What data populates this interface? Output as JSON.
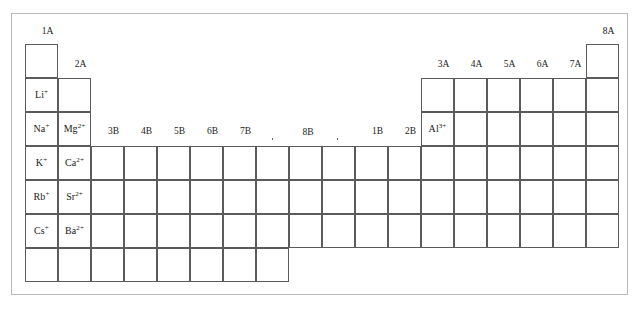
{
  "figure": {
    "frame": {
      "x": 11,
      "y": 13,
      "width": 617,
      "height": 282
    }
  },
  "grid": {
    "cell_width": 33,
    "cell_height": 34,
    "origin_x": 25,
    "origin_y": 44,
    "columns": 18,
    "rows": 7
  },
  "group_headers": [
    {
      "label": "1A",
      "column": 1,
      "x": 31,
      "y": 27
    },
    {
      "label": "2A",
      "column": 2,
      "x": 64,
      "y": 60
    },
    {
      "label": "3B",
      "column": 3,
      "x": 97,
      "y": 127
    },
    {
      "label": "4B",
      "column": 4,
      "x": 130,
      "y": 127
    },
    {
      "label": "5B",
      "column": 5,
      "x": 163,
      "y": 127
    },
    {
      "label": "6B",
      "column": 6,
      "x": 196,
      "y": 127
    },
    {
      "label": "7B",
      "column": 7,
      "x": 229,
      "y": 127
    },
    {
      "label": "1B",
      "column": 11,
      "x": 361,
      "y": 127
    },
    {
      "label": "2B",
      "column": 12,
      "x": 394,
      "y": 127
    },
    {
      "label": "3A",
      "column": 13,
      "x": 427,
      "y": 60
    },
    {
      "label": "4A",
      "column": 14,
      "x": 460,
      "y": 60
    },
    {
      "label": "5A",
      "column": 15,
      "x": 493,
      "y": 60
    },
    {
      "label": "6A",
      "column": 16,
      "x": 526,
      "y": 60
    },
    {
      "label": "7A",
      "column": 17,
      "x": 559,
      "y": 60
    },
    {
      "label": "8A",
      "column": 18,
      "x": 592,
      "y": 27
    }
  ],
  "bracket_8b": {
    "label": "8B",
    "start_column": 8,
    "end_column": 10,
    "x": 272,
    "y": 134,
    "width": 66
  },
  "ions": [
    {
      "symbol": "Li",
      "charge": "+",
      "column": 1,
      "row": 2
    },
    {
      "symbol": "Na",
      "charge": "+",
      "column": 1,
      "row": 3
    },
    {
      "symbol": "K",
      "charge": "+",
      "column": 1,
      "row": 4
    },
    {
      "symbol": "Rb",
      "charge": "+",
      "column": 1,
      "row": 5
    },
    {
      "symbol": "Cs",
      "charge": "+",
      "column": 1,
      "row": 6
    },
    {
      "symbol": "Mg",
      "charge": "2+",
      "column": 2,
      "row": 3
    },
    {
      "symbol": "Ca",
      "charge": "2+",
      "column": 2,
      "row": 4
    },
    {
      "symbol": "Sr",
      "charge": "2+",
      "column": 2,
      "row": 5
    },
    {
      "symbol": "Ba",
      "charge": "2+",
      "column": 2,
      "row": 6
    },
    {
      "symbol": "Al",
      "charge": "3+",
      "column": 13,
      "row": 3
    }
  ],
  "column_extents": [
    {
      "column": 1,
      "first_row": 1,
      "last_row": 7
    },
    {
      "column": 2,
      "first_row": 2,
      "last_row": 7
    },
    {
      "column": 3,
      "first_row": 4,
      "last_row": 7
    },
    {
      "column": 4,
      "first_row": 4,
      "last_row": 7
    },
    {
      "column": 5,
      "first_row": 4,
      "last_row": 7
    },
    {
      "column": 6,
      "first_row": 4,
      "last_row": 7
    },
    {
      "column": 7,
      "first_row": 4,
      "last_row": 7
    },
    {
      "column": 8,
      "first_row": 4,
      "last_row": 7
    },
    {
      "column": 9,
      "first_row": 4,
      "last_row": 6
    },
    {
      "column": 10,
      "first_row": 4,
      "last_row": 6
    },
    {
      "column": 11,
      "first_row": 4,
      "last_row": 6
    },
    {
      "column": 12,
      "first_row": 4,
      "last_row": 6
    },
    {
      "column": 13,
      "first_row": 2,
      "last_row": 6
    },
    {
      "column": 14,
      "first_row": 2,
      "last_row": 6
    },
    {
      "column": 15,
      "first_row": 2,
      "last_row": 6
    },
    {
      "column": 16,
      "first_row": 2,
      "last_row": 6
    },
    {
      "column": 17,
      "first_row": 2,
      "last_row": 6
    },
    {
      "column": 18,
      "first_row": 1,
      "last_row": 6
    }
  ],
  "colors": {
    "cell_border": "#5b5b5b",
    "frame_border": "#b9b9b9",
    "text": "#1a1a1a",
    "background": "#ffffff"
  }
}
